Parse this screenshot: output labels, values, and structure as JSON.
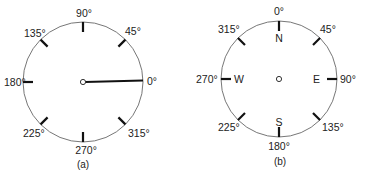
{
  "diagram_a": {
    "caption": "(a)",
    "labels": {
      "d0": "0°",
      "d45": "45°",
      "d90": "90°",
      "d135": "135°",
      "d180": "180°",
      "d225": "225°",
      "d270": "270°",
      "d315": "315°"
    },
    "convention": "mathematical angle, counterclockwise from east",
    "pointer_direction": "0°"
  },
  "diagram_b": {
    "caption": "(b)",
    "labels": {
      "d0": "0°",
      "d45": "45°",
      "d90": "90°",
      "d135": "135°",
      "d180": "180°",
      "d225": "225°",
      "d270": "270°",
      "d315": "315°"
    },
    "cardinals": {
      "n": "N",
      "e": "E",
      "s": "S",
      "w": "W"
    },
    "convention": "compass bearing, clockwise from north"
  },
  "colors": {
    "ink": "#111111",
    "ring": "#777777",
    "background": "#ffffff"
  }
}
